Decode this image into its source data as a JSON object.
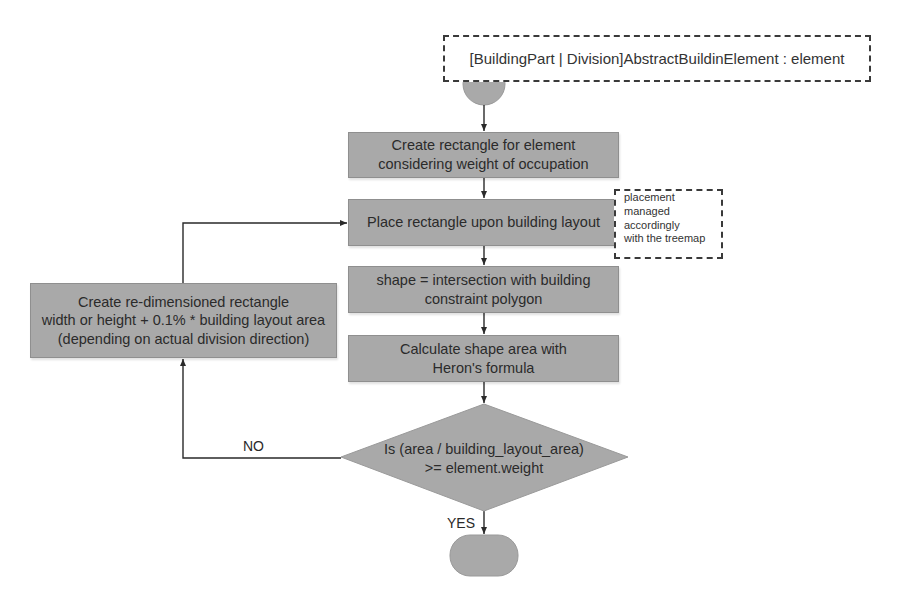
{
  "diagram": {
    "type": "flowchart",
    "colors": {
      "node_fill": "#a9a9a9",
      "line": "#2a2a2a",
      "note_border": "#3a3a3a"
    },
    "input_note": {
      "text": "[BuildingPart | Division]AbstractBuildinElement : element"
    },
    "start_node": {
      "shape": "circle"
    },
    "steps": [
      {
        "id": "create-rectangle",
        "lines": [
          "Create rectangle for element",
          "considering weight of occupation"
        ]
      },
      {
        "id": "place-rectangle",
        "lines": [
          "Place rectangle upon building layout"
        ]
      },
      {
        "id": "intersection",
        "lines": [
          "shape = intersection with building",
          "constraint polygon"
        ]
      },
      {
        "id": "calculate-area",
        "lines": [
          "Calculate shape area with",
          "Heron's formula"
        ]
      }
    ],
    "side_note": {
      "lines": [
        "placement",
        "managed",
        "accordingly",
        "with the treemap"
      ]
    },
    "decision": {
      "lines": [
        "Is (area / building_layout_area)",
        ">= element.weight"
      ],
      "yes_label": "YES",
      "no_label": "NO"
    },
    "loop_step": {
      "lines": [
        "Create re-dimensioned rectangle",
        "width or height + 0.1% * building layout area",
        "(depending on actual division direction)"
      ]
    },
    "end_node": {
      "shape": "terminal"
    },
    "edges": [
      {
        "from": "start",
        "to": "create-rectangle"
      },
      {
        "from": "create-rectangle",
        "to": "place-rectangle"
      },
      {
        "from": "place-rectangle",
        "to": "intersection"
      },
      {
        "from": "intersection",
        "to": "calculate-area"
      },
      {
        "from": "calculate-area",
        "to": "decision"
      },
      {
        "from": "decision",
        "to": "end",
        "label": "YES"
      },
      {
        "from": "decision",
        "to": "loop-step",
        "label": "NO"
      },
      {
        "from": "loop-step",
        "to": "place-rectangle"
      }
    ]
  }
}
